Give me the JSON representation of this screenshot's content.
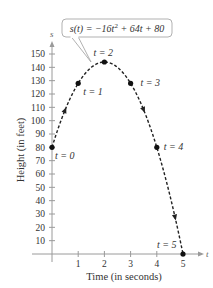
{
  "chart_data": {
    "type": "line",
    "title": "",
    "xlabel": "Time (in seconds)",
    "ylabel": "Height (in feet)",
    "x_axis_var": "t",
    "y_axis_var": "s",
    "xlim": [
      0,
      5
    ],
    "ylim": [
      0,
      150
    ],
    "xticks": [
      1,
      2,
      3,
      4,
      5
    ],
    "yticks": [
      10,
      20,
      30,
      40,
      50,
      60,
      70,
      80,
      90,
      100,
      110,
      120,
      130,
      140,
      150
    ],
    "grid": false,
    "legend": null,
    "annotation": {
      "text_parts": [
        "s(t) = −16t",
        "2",
        " + 64t + 80"
      ],
      "full_text": "s(t) = −16t² + 64t + 80"
    },
    "function": {
      "a": -16,
      "b": 64,
      "c": 80
    },
    "series": [
      {
        "name": "s(t)",
        "style": "dashed",
        "color": "#222222",
        "x": [
          0,
          1,
          2,
          3,
          4,
          5
        ],
        "values": [
          80,
          128,
          144,
          128,
          80,
          0
        ],
        "point_labels": [
          "t = 0",
          "t = 1",
          "t = 2",
          "t = 3",
          "t = 4",
          "t = 5"
        ]
      }
    ]
  }
}
